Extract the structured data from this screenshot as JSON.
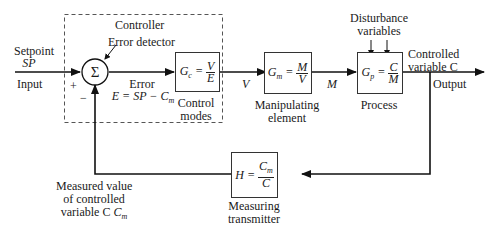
{
  "diagram": {
    "type": "feedback-control-block-diagram",
    "controller_group": {
      "label": "Controller"
    },
    "summing_junction": {
      "symbol": "Σ",
      "label": "Error detector",
      "plus_sign": "+",
      "minus_sign": "−"
    },
    "input": {
      "label_line1": "Setpoint",
      "label_line2": "SP",
      "label_below": "Input"
    },
    "error": {
      "label": "Error",
      "equation": "E = SP − C",
      "equation_sub": "m"
    },
    "blocks": [
      {
        "id": "controller",
        "lhs": "G",
        "lhs_sub": "c",
        "num": "V",
        "den": "E",
        "caption_line1": "Control",
        "caption_line2": "modes"
      },
      {
        "id": "manipulating",
        "lhs": "G",
        "lhs_sub": "m",
        "num": "M",
        "den": "V",
        "caption_line1": "Manipulating",
        "caption_line2": "element"
      },
      {
        "id": "process",
        "lhs": "G",
        "lhs_sub": "p",
        "num": "C",
        "den": "M",
        "caption_line1": "Process",
        "caption_line2": ""
      },
      {
        "id": "transmitter",
        "lhs": "H",
        "lhs_sub": "",
        "num": "C",
        "num_sub": "m",
        "den": "C",
        "caption_line1": "Measuring",
        "caption_line2": "transmitter"
      }
    ],
    "signals": {
      "v": "V",
      "m": "M"
    },
    "disturbance": {
      "line1": "Disturbance",
      "line2": "variables"
    },
    "output": {
      "label_line1": "Controlled",
      "label_line2": "variable C",
      "label_below": "Output"
    },
    "feedback": {
      "line1": "Measured value",
      "line2": "of controlled",
      "line3": "variable C",
      "line3_sub": "m"
    }
  }
}
